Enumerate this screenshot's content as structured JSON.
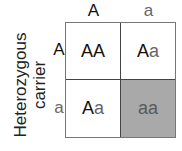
{
  "side_label": [
    "Heterozygous",
    "carrier"
  ],
  "columns": [
    {
      "allele": "A",
      "type": "dominant"
    },
    {
      "allele": "a",
      "type": "recessive"
    }
  ],
  "rows": [
    {
      "allele": "A",
      "type": "dominant"
    },
    {
      "allele": "a",
      "type": "recessive"
    }
  ],
  "cells": [
    [
      {
        "dom": "AA",
        "rec": "",
        "shaded": false
      },
      {
        "dom": "A",
        "rec": "a",
        "shaded": false
      }
    ],
    [
      {
        "dom": "A",
        "rec": "a",
        "shaded": false
      },
      {
        "dom": "",
        "rec": "aa",
        "shaded": true
      }
    ]
  ],
  "colors": {
    "dominant_text": "#111111",
    "recessive_text": "#666666",
    "shaded_fill": "#a9a9a9",
    "grid_line": "#777777"
  }
}
